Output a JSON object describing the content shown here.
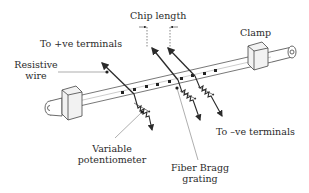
{
  "diagram": {
    "labels": {
      "chip_length": "Chip length",
      "to_positive": "To +ve terminals",
      "clamp": "Clamp",
      "resistive_wire_line1": "Resistive",
      "resistive_wire_line2": "wire",
      "to_negative": "To –ve terminals",
      "variable_pot_line1": "Variable",
      "variable_pot_line2": "potentiometer",
      "fbg_line1": "Fiber Bragg",
      "fbg_line2": "grating"
    },
    "components": [
      "fiber",
      "left-clamp",
      "right-clamp",
      "resistive-wire",
      "fbg-chips",
      "potentiometers"
    ],
    "colors": {
      "line": "#2b2b2b",
      "leader": "#777777",
      "background": "#ffffff"
    }
  }
}
